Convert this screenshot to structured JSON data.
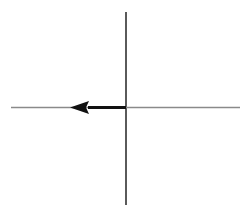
{
  "figure": {
    "title": "Coordinate axes with leftward horizontal vector",
    "background_color": "#ffffff",
    "width": 252,
    "height": 211
  },
  "canvas": {
    "origin_x": 126,
    "origin_y": 107.5
  },
  "axes": {
    "vertical": {
      "name": "vertical-axis",
      "x": 126,
      "y_top": 12,
      "y_bottom": 205,
      "stroke_color": "#5a5a5a",
      "stroke_width": 2.0
    },
    "horizontal": {
      "name": "horizontal-axis",
      "y": 107.5,
      "x_left": 11,
      "x_right": 240,
      "stroke_color": "#8a8a8a",
      "stroke_width": 1.4
    }
  },
  "vector": {
    "name": "leftward-vector",
    "direction": "left",
    "tail_x": 126,
    "tail_y": 107.5,
    "head_tip_x": 70,
    "head_tip_y": 107.5,
    "shaft_start_x": 88,
    "shaft_stroke_color": "#111111",
    "shaft_stroke_width": 3.2,
    "arrowhead": {
      "name": "arrowhead-left",
      "tip_x": 70,
      "base_x": 88,
      "half_height": 6.5,
      "fill_color": "#111111"
    }
  },
  "colors": {
    "ink_dark": "#111111",
    "ink_mid": "#5a5a5a",
    "ink_light": "#8a8a8a",
    "background": "#ffffff"
  },
  "labels": {
    "x_axis_label": "",
    "y_axis_label": "",
    "origin_label": "",
    "vector_label": ""
  },
  "chart_data": {
    "type": "line",
    "title": "Coordinate axes with leftward horizontal vector",
    "xlabel": "",
    "ylabel": "",
    "grid": false,
    "legend": null,
    "xlim": [
      -115,
      114
    ],
    "ylim": [
      -97,
      95
    ],
    "series": [
      {
        "name": "vertical-axis",
        "kind": "line",
        "x": [
          0,
          0
        ],
        "y": [
          95,
          -97
        ]
      },
      {
        "name": "horizontal-axis",
        "kind": "line",
        "x": [
          -115,
          114
        ],
        "y": [
          0,
          0
        ]
      },
      {
        "name": "leftward-vector",
        "kind": "arrow",
        "x": [
          0,
          -56
        ],
        "y": [
          0,
          0
        ],
        "annotation": "arrow points left from origin"
      }
    ],
    "annotations": [
      {
        "text": "arrowhead",
        "x": -56,
        "y": 0
      }
    ]
  }
}
